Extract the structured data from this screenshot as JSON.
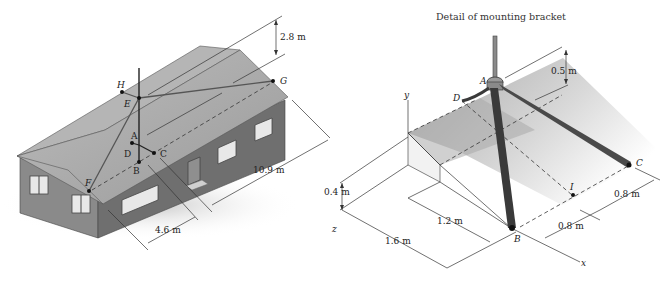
{
  "figure": {
    "left_panel": {
      "name": "house-with-antenna",
      "points": [
        "A",
        "B",
        "C",
        "D",
        "E",
        "F",
        "G",
        "H"
      ],
      "dimensions": {
        "height_above": "2.8 m",
        "length": "10.9 m",
        "offset": "4.6 m"
      },
      "axis_label": "z"
    },
    "right_panel": {
      "title": "Detail of mounting bracket",
      "points": [
        "A",
        "B",
        "C",
        "D",
        "I"
      ],
      "axes": {
        "y": "y",
        "x": "x",
        "z": "z"
      },
      "dimensions": {
        "height_A": "0.5 m",
        "roof_rise": "0.4 m",
        "inner_width": "1.2 m",
        "total_width": "1.6 m",
        "B_to_I": "0.8 m",
        "I_to_C": "0.8 m"
      }
    }
  },
  "colors": {
    "roof": "#a9a9a9",
    "wall": "#7f7f7f",
    "wall_dark": "#6a6a6a",
    "line": "#333333",
    "bracket_leg": "#3a3a3a"
  }
}
